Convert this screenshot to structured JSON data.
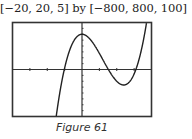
{
  "window_label": "[−20, 20, 5] by [−800, 800, 100]",
  "caption": "Figure 61",
  "chart_data": {
    "type": "line",
    "title": "",
    "xlabel": "",
    "ylabel": "",
    "xlim": [
      -20,
      20
    ],
    "ylim": [
      -800,
      800
    ],
    "xscale": 5,
    "yscale": 100,
    "grid": false,
    "series": [
      {
        "name": "y = x^3 - 18x^2 + 600 (approx.)",
        "x": [
          -20,
          -16,
          -12,
          -8,
          -6,
          -5,
          -4,
          -2,
          0,
          2,
          4,
          6,
          8,
          10,
          12,
          14,
          16,
          17,
          18,
          20
        ],
        "y": [
          -15400,
          -8104,
          -3720,
          -1064,
          -264,
          -67,
          248,
          520,
          600,
          536,
          376,
          168,
          -40,
          -200,
          -264,
          -184,
          88,
          311,
          600,
          1600
        ]
      }
    ],
    "key_points": {
      "local_max": [
        0,
        600
      ],
      "local_min": [
        12,
        -264
      ],
      "x_intercepts": [
        -5.1,
        7.6,
        15.5
      ]
    }
  }
}
